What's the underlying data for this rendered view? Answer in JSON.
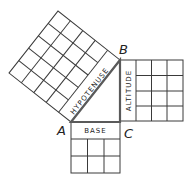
{
  "diagram": {
    "vertices": {
      "A": "A",
      "B": "B",
      "C": "C"
    },
    "sides": {
      "hypotenuse": {
        "label": "HYPOTENUSE",
        "grid": "5x5"
      },
      "altitude": {
        "label": "ALTITUDE",
        "grid": "4x4"
      },
      "base": {
        "label": "BASE",
        "grid": "3x3"
      }
    }
  }
}
